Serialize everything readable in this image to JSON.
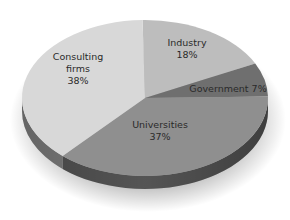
{
  "chart_data": {
    "type": "pie",
    "title": "",
    "style": "3d-exploded-ellipse",
    "categories": [
      "Industry",
      "Government",
      "Universities",
      "Consulting firms"
    ],
    "values": [
      18,
      7,
      37,
      38
    ],
    "unit": "%",
    "colors": [
      "#bdbdbd",
      "#6f6f6f",
      "#8f8f8f",
      "#d8d8d8"
    ],
    "labels": [
      {
        "lines": [
          "Industry",
          "18%"
        ]
      },
      {
        "lines": [
          "Government  7%"
        ]
      },
      {
        "lines": [
          "Universities",
          "37%"
        ]
      },
      {
        "lines": [
          "Consulting",
          "firms",
          "38%"
        ]
      }
    ]
  }
}
